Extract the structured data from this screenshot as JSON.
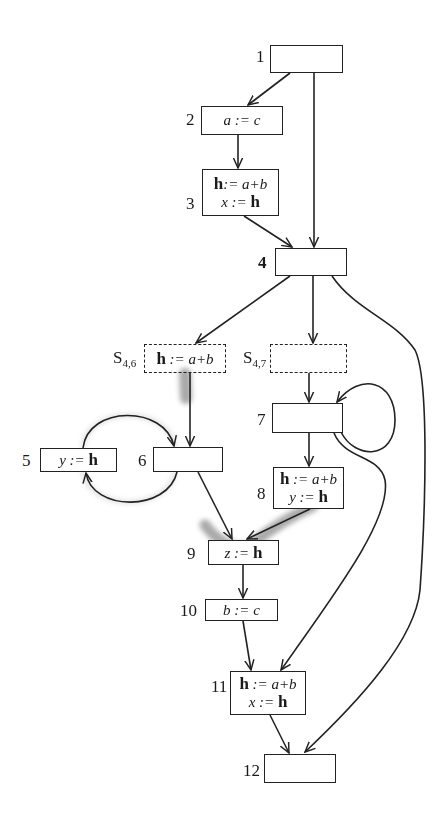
{
  "diagram": {
    "type": "control-flow-graph",
    "nodes": [
      {
        "id": "1",
        "label": "1",
        "statements": []
      },
      {
        "id": "2",
        "label": "2",
        "statements": [
          [
            "a := c"
          ]
        ]
      },
      {
        "id": "3",
        "label": "3",
        "statements": [
          [
            "h",
            ":= a+b"
          ],
          [
            "x := ",
            "h"
          ]
        ]
      },
      {
        "id": "4",
        "label": "4",
        "statements": []
      },
      {
        "id": "s46",
        "label": "S",
        "label_sub": "4,6",
        "statements": [
          [
            "h",
            " := a+b"
          ]
        ],
        "dashed": true
      },
      {
        "id": "s47",
        "label": "S",
        "label_sub": "4,7",
        "statements": [],
        "dashed": true
      },
      {
        "id": "5",
        "label": "5",
        "statements": [
          [
            "y := ",
            "h"
          ]
        ]
      },
      {
        "id": "6",
        "label": "6",
        "statements": []
      },
      {
        "id": "7",
        "label": "7",
        "statements": []
      },
      {
        "id": "8",
        "label": "8",
        "statements": [
          [
            "h",
            " := a+b"
          ],
          [
            "y := ",
            "h"
          ]
        ]
      },
      {
        "id": "9",
        "label": "9",
        "statements": [
          [
            "z := ",
            "h"
          ]
        ]
      },
      {
        "id": "10",
        "label": "10",
        "statements": [
          [
            "b := c"
          ]
        ]
      },
      {
        "id": "11",
        "label": "11",
        "statements": [
          [
            "h",
            "  := a+b"
          ],
          [
            "x := ",
            "h"
          ]
        ]
      },
      {
        "id": "12",
        "label": "12",
        "statements": []
      }
    ],
    "edges": [
      [
        "1",
        "2"
      ],
      [
        "1",
        "4"
      ],
      [
        "2",
        "3"
      ],
      [
        "3",
        "4"
      ],
      [
        "4",
        "s46"
      ],
      [
        "4",
        "s47"
      ],
      [
        "4",
        "12"
      ],
      [
        "s46",
        "6"
      ],
      [
        "s47",
        "7"
      ],
      [
        "6",
        "5"
      ],
      [
        "5",
        "6"
      ],
      [
        "6",
        "9"
      ],
      [
        "7",
        "7"
      ],
      [
        "7",
        "8"
      ],
      [
        "7",
        "11"
      ],
      [
        "8",
        "9"
      ],
      [
        "9",
        "10"
      ],
      [
        "10",
        "11"
      ],
      [
        "11",
        "12"
      ]
    ],
    "highlighted_paths": [
      "s46->6",
      "6->5",
      "5->6",
      "6->9",
      "8->9"
    ],
    "colors": {
      "line": "#222222",
      "highlight": "#9a9a9a",
      "background": "#ffffff"
    }
  },
  "labels": {
    "n1": "1",
    "n2": "2",
    "n3": "3",
    "n4": "4",
    "n5": "5",
    "n6": "6",
    "n7": "7",
    "n8": "8",
    "n9": "9",
    "n10": "10",
    "n11": "11",
    "n12": "12",
    "s_letter": "S",
    "s46_sub": "4,6",
    "s47_sub": "4,7"
  },
  "text": {
    "b2_l1": "a := c",
    "h": "h",
    "b3_l1_rest": ":= a+b",
    "b3_l2_pre": "x := ",
    "s46_rest": " := a+b",
    "b5_pre": "y := ",
    "b8_l1_rest": " := a+b",
    "b8_l2_pre": "y := ",
    "b9_pre": "z := ",
    "b10_l1": "b := c",
    "b11_l1_rest": "  := a+b",
    "b11_l2_pre": "x := "
  }
}
